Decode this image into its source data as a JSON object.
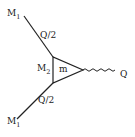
{
  "diagram": {
    "type": "feynman-triangle-vertex",
    "labels": {
      "top_particle": "M",
      "top_particle_sub": "1",
      "bottom_particle": "M",
      "bottom_particle_sub": "1",
      "internal_mass": "M",
      "internal_mass_sub": "2",
      "loop_mass": "m",
      "top_momentum": "Q/2",
      "bottom_momentum": "Q/2",
      "boson": "Q"
    },
    "colors": {
      "line": "#222222",
      "background": "#ffffff"
    }
  }
}
